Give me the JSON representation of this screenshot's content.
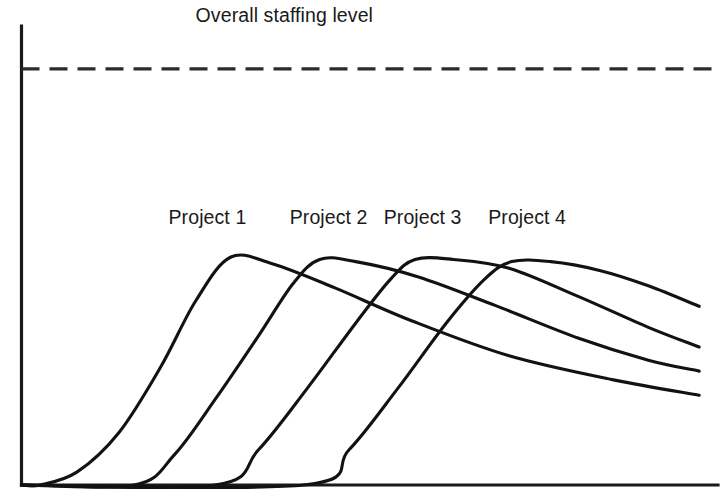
{
  "chart_data": {
    "type": "line",
    "title": "",
    "xlabel": "Time",
    "ylabel": "Staffing level",
    "grid": false,
    "legend_position": "inline-above-peaks",
    "axis_ranges": {
      "x": [
        0,
        100
      ],
      "y": [
        0,
        100
      ]
    },
    "annotations": [
      {
        "name": "overall-staffing-level",
        "label": "Overall staffing level",
        "kind": "horizontal-threshold",
        "y_value": 95,
        "style": "dashed",
        "label_x": 25,
        "label_y": 100
      }
    ],
    "series": [
      {
        "name": "Project 1",
        "label": "Project 1",
        "label_x": 21.1,
        "label_y": 59.5,
        "start_x": 2.7,
        "peak_x": 30.0,
        "peak_y": 52.0,
        "end_x": 97.3,
        "end_y": 20.5,
        "points": [
          {
            "x": 0.0,
            "y": 0.0
          },
          {
            "x": 2.7,
            "y": 0.0
          },
          {
            "x": 8.0,
            "y": 3.0
          },
          {
            "x": 14.0,
            "y": 12.0
          },
          {
            "x": 20.0,
            "y": 27.0
          },
          {
            "x": 25.0,
            "y": 42.0
          },
          {
            "x": 30.0,
            "y": 52.0
          },
          {
            "x": 36.0,
            "y": 50.5
          },
          {
            "x": 45.0,
            "y": 45.0
          },
          {
            "x": 56.0,
            "y": 37.5
          },
          {
            "x": 70.0,
            "y": 29.5
          },
          {
            "x": 85.0,
            "y": 24.0
          },
          {
            "x": 97.3,
            "y": 20.5
          }
        ]
      },
      {
        "name": "Project 2",
        "label": "Project 2",
        "label_x": 38.5,
        "label_y": 59.5,
        "start_x": 16.2,
        "peak_x": 42.8,
        "peak_y": 51.5,
        "end_x": 97.3,
        "end_y": 26.0,
        "points": [
          {
            "x": 0.0,
            "y": 0.0
          },
          {
            "x": 16.2,
            "y": 0.0
          },
          {
            "x": 22.0,
            "y": 7.0
          },
          {
            "x": 28.0,
            "y": 20.0
          },
          {
            "x": 34.0,
            "y": 34.0
          },
          {
            "x": 39.0,
            "y": 46.0
          },
          {
            "x": 42.8,
            "y": 51.5
          },
          {
            "x": 48.0,
            "y": 51.0
          },
          {
            "x": 57.0,
            "y": 47.5
          },
          {
            "x": 68.0,
            "y": 41.0
          },
          {
            "x": 80.0,
            "y": 33.5
          },
          {
            "x": 90.0,
            "y": 28.5
          },
          {
            "x": 97.3,
            "y": 26.0
          }
        ]
      },
      {
        "name": "Project 3",
        "label": "Project 3",
        "label_x": 52.0,
        "label_y": 59.5,
        "start_x": 27.8,
        "peak_x": 56.5,
        "peak_y": 51.5,
        "end_x": 97.3,
        "end_y": 31.5,
        "points": [
          {
            "x": 0.0,
            "y": 0.0
          },
          {
            "x": 27.8,
            "y": 0.0
          },
          {
            "x": 34.0,
            "y": 8.0
          },
          {
            "x": 41.0,
            "y": 22.0
          },
          {
            "x": 48.0,
            "y": 37.0
          },
          {
            "x": 53.0,
            "y": 47.0
          },
          {
            "x": 56.5,
            "y": 51.5
          },
          {
            "x": 62.0,
            "y": 51.5
          },
          {
            "x": 70.0,
            "y": 49.5
          },
          {
            "x": 80.0,
            "y": 43.0
          },
          {
            "x": 90.0,
            "y": 36.0
          },
          {
            "x": 97.3,
            "y": 31.5
          }
        ]
      },
      {
        "name": "Project 4",
        "label": "Project 4",
        "label_x": 67.0,
        "label_y": 59.5,
        "start_x": 40.5,
        "peak_x": 70.4,
        "peak_y": 51.0,
        "end_x": 97.3,
        "end_y": 40.8,
        "points": [
          {
            "x": 0.0,
            "y": 0.0
          },
          {
            "x": 40.5,
            "y": 0.0
          },
          {
            "x": 47.0,
            "y": 8.0
          },
          {
            "x": 54.0,
            "y": 22.0
          },
          {
            "x": 61.0,
            "y": 37.0
          },
          {
            "x": 66.5,
            "y": 47.0
          },
          {
            "x": 70.4,
            "y": 51.0
          },
          {
            "x": 76.0,
            "y": 51.0
          },
          {
            "x": 83.0,
            "y": 49.0
          },
          {
            "x": 90.0,
            "y": 45.5
          },
          {
            "x": 97.3,
            "y": 40.8
          }
        ]
      }
    ],
    "colors": {
      "curve": "#121212",
      "axis": "#1a1a1a",
      "threshold": "#2b2b2b",
      "background": "#ffffff",
      "text": "#1a1a1a"
    }
  }
}
